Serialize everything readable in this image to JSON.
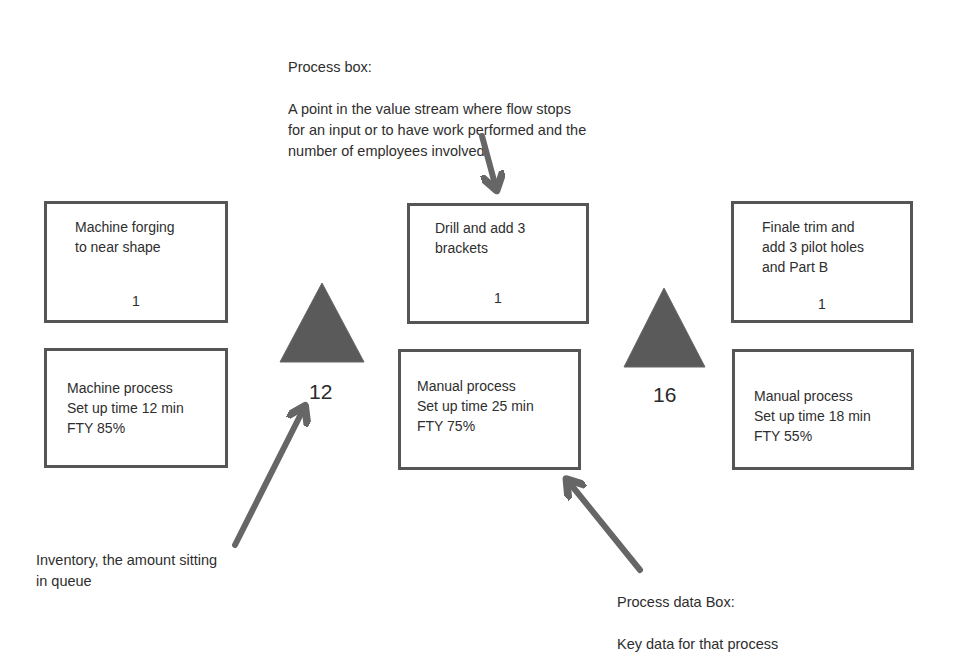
{
  "diagram": {
    "type": "value-stream-map-legend",
    "colors": {
      "box_border": "#555555",
      "triangle_fill": "#5a5a5a",
      "arrow": "#666666",
      "text": "#2e2e2e"
    },
    "annotations": {
      "process_box": {
        "title": "Process box:",
        "body": "A point in the value stream where flow stops\nfor an input or to have work performed and the\nnumber of employees involved"
      },
      "inventory": {
        "body": "Inventory, the amount sitting\nin queue"
      },
      "process_data_box": {
        "title": "Process data Box:",
        "body": "Key data for that process"
      }
    },
    "processes": [
      {
        "name": "Machine forging\nto near shape",
        "operators": "1",
        "data": "Machine process\nSet up time 12 min\nFTY 85%"
      },
      {
        "name": "Drill and add 3\nbrackets",
        "operators": "1",
        "data": "Manual process\nSet up time 25 min\nFTY 75%"
      },
      {
        "name": "Finale trim and\nadd 3 pilot holes\nand Part B",
        "operators": "1",
        "data": "Manual process\nSet up time 18 min\nFTY 55%"
      }
    ],
    "inventories": [
      {
        "icon": "inventory-triangle-icon",
        "quantity": "12"
      },
      {
        "icon": "inventory-triangle-icon",
        "quantity": "16"
      }
    ]
  }
}
